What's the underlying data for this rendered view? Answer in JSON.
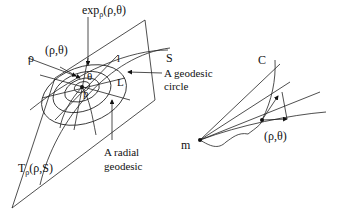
{
  "labels": {
    "exp": "exp",
    "exp_sub": "ρ",
    "exp_args": "(ρ,θ)",
    "rho_theta_left": "(ρ,θ)",
    "rho": "ρ",
    "S": "S",
    "l": "l",
    "theta": "θ",
    "L": "L",
    "p": "p",
    "geodesic_circle_1": "A geodesic",
    "geodesic_circle_2": "circle",
    "radial_1": "A radial",
    "radial_2": "geodesic",
    "T": "T",
    "T_sub": "ρ",
    "T_args": "(ρ,S)",
    "C": "C",
    "m": "m",
    "rho_theta_right": "(ρ,θ)"
  }
}
